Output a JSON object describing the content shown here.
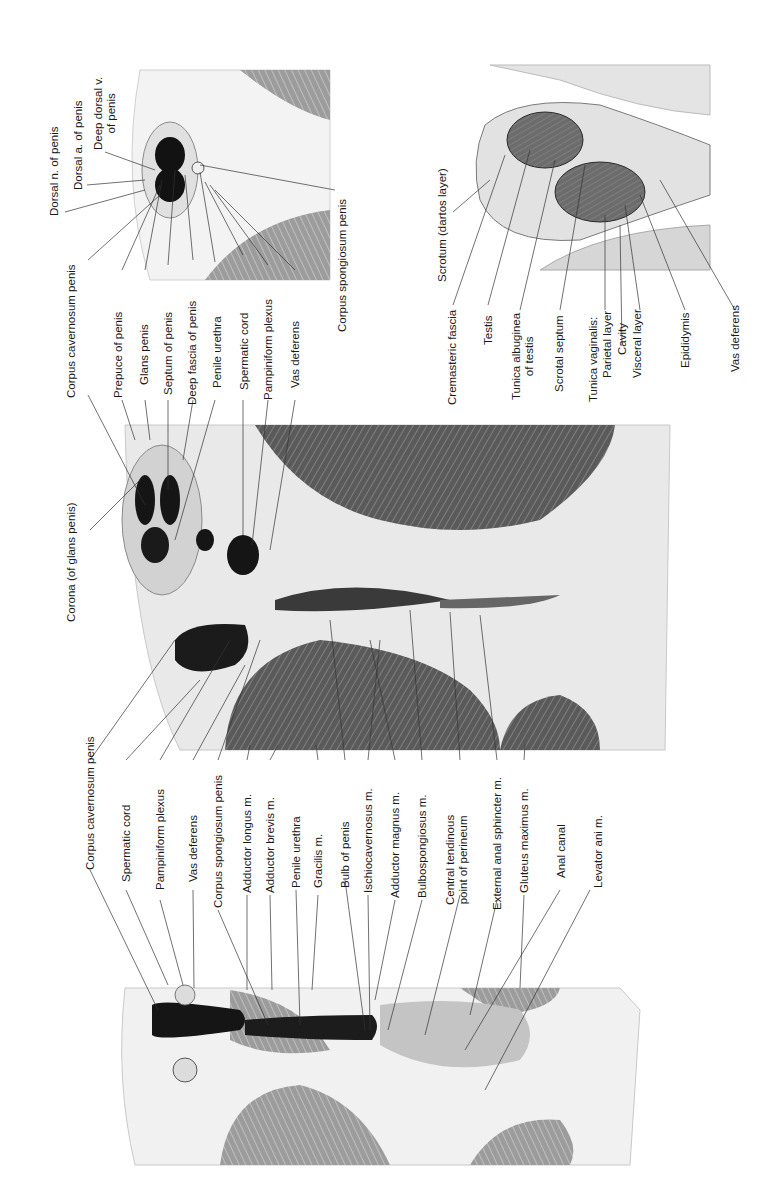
{
  "figure": {
    "orientation": "rotated-90-ccw",
    "panels": [
      {
        "id": "cross-section-penis-root",
        "description": "Transverse section through perineum showing corpus cavernosum, bulb of penis and anal canal",
        "labels": [
          "Corpus cavernosum penis",
          "Spermatic cord",
          "Pampiniform plexus",
          "Vas deferens",
          "Corpus spongiosum penis",
          "Adductor longus m.",
          "Adductor brevis m.",
          "Penile urethra",
          "Gracilis m.",
          "Bulb of penis",
          "Ischiocavernosus m.",
          "Adductor magnus m.",
          "Bulbospongiosus m.",
          "Central tendinous\npoint of perineum",
          "External anal sphincter m.",
          "Gluteus maximus m.",
          "Anal canal",
          "Levator ani m."
        ]
      },
      {
        "id": "sagittal-section-glans",
        "description": "Section through glans penis and perineum",
        "labels": [
          "Corona (of glans penis)",
          "Corpus cavernosum penis",
          "Prepuce of penis",
          "Glans penis",
          "Septum of penis",
          "Deep fascia of penis",
          "Penile urethra",
          "Spermatic cord",
          "Pampiniform plexus",
          "Vas deferens"
        ]
      },
      {
        "id": "cross-section-penis-shaft",
        "description": "Transverse section through shaft of penis",
        "labels": [
          "Dorsal n. of penis",
          "Dorsal a. of penis",
          "Deep dorsal v.\nof penis",
          "Corpus spongiosum penis"
        ]
      },
      {
        "id": "section-scrotum",
        "description": "Section through scrotum and testes",
        "labels": [
          "Scrotum (dartos layer)",
          "Cremasteric fascia",
          "Testis",
          "Tunica albuginea\nof testis",
          "Scrotal septum",
          "Tunica vaginalis:",
          "Parietal layer",
          "Cavity",
          "Visceral layer",
          "Epididymis",
          "Vas deferens"
        ]
      }
    ]
  },
  "colors": {
    "background": "#ffffff",
    "label_text": "#1a1a1a",
    "leader_line": "#333333",
    "muscle_dark": "#4a4a4a",
    "muscle_mid": "#8a8a8a",
    "fat_light": "#e6e6e6",
    "erectile_black": "#141414"
  }
}
